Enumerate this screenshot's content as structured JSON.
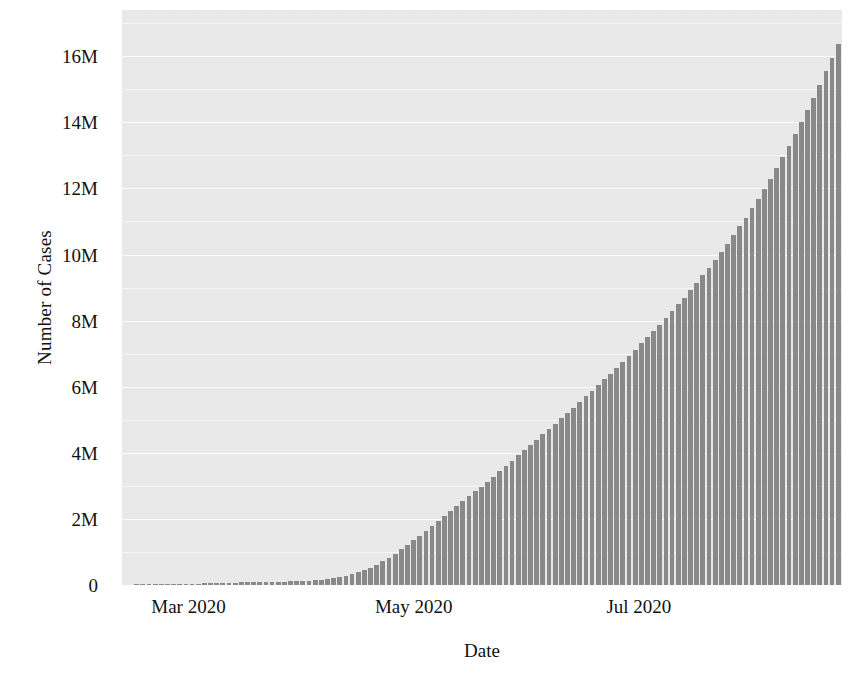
{
  "chart_data": {
    "type": "bar",
    "title": "",
    "subtitle": "",
    "xlabel": "Date",
    "ylabel": "Number of Cases",
    "grid": true,
    "legend": null,
    "bar_color": "#8a8a8a",
    "plot_background": "#eaeaea",
    "gridline_color": "#fbfbfb",
    "ylim": [
      0,
      17400000
    ],
    "ytick_values": [
      0,
      2000000,
      4000000,
      6000000,
      8000000,
      10000000,
      12000000,
      14000000,
      16000000
    ],
    "ytick_labels": [
      "0",
      "2M",
      "4M",
      "6M",
      "8M",
      "10M",
      "12M",
      "14M",
      "16M"
    ],
    "xtick_labels": [
      "Mar 2020",
      "May 2020",
      "Jul 2020"
    ],
    "xtick_positions_days": [
      18,
      79,
      140
    ],
    "x_range_days": [
      0,
      195
    ],
    "x_start_label": "Feb 2020",
    "x_end_label": "Aug 2020",
    "series_name": "Cumulative confirmed cases",
    "note": "values are cumulative case counts, one bar per day",
    "values": [
      12000,
      14000,
      17000,
      19000,
      21000,
      23000,
      26000,
      28000,
      31000,
      34000,
      37000,
      40000,
      44000,
      48000,
      53000,
      58000,
      63000,
      69000,
      75000,
      81000,
      86000,
      89000,
      92000,
      95000,
      98000,
      101000,
      105000,
      110000,
      116000,
      124000,
      134000,
      146000,
      162000,
      182000,
      208000,
      240000,
      279000,
      327000,
      385000,
      452000,
      530000,
      620000,
      720000,
      830000,
      950000,
      1080000,
      1210000,
      1350000,
      1490000,
      1630000,
      1780000,
      1930000,
      2080000,
      2230000,
      2380000,
      2530000,
      2680000,
      2830000,
      2980000,
      3130000,
      3280000,
      3440000,
      3600000,
      3760000,
      3920000,
      4080000,
      4240000,
      4400000,
      4560000,
      4720000,
      4880000,
      5040000,
      5200000,
      5370000,
      5540000,
      5710000,
      5880000,
      6050000,
      6220000,
      6400000,
      6580000,
      6760000,
      6940000,
      7120000,
      7310000,
      7500000,
      7690000,
      7880000,
      8080000,
      8280000,
      8490000,
      8700000,
      8920000,
      9140000,
      9370000,
      9600000,
      9840000,
      10080000,
      10330000,
      10590000,
      10850000,
      11120000,
      11400000,
      11690000,
      11990000,
      12300000,
      12620000,
      12950000,
      13290000,
      13640000,
      14000000,
      14370000,
      14750000,
      15140000,
      15540000,
      15950000,
      16370000
    ]
  },
  "axes": {
    "ylabel": "Number of Cases",
    "xlabel": "Date"
  }
}
